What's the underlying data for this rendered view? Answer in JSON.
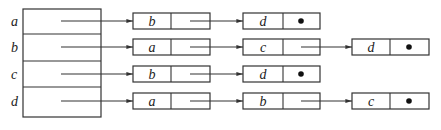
{
  "diagram": {
    "title": "",
    "type": "adjacency-list",
    "colors": {
      "line": "#333333",
      "text": "#222222",
      "background": "#ffffff"
    },
    "headers": [
      {
        "label": "a",
        "list": [
          {
            "value": "b",
            "next": null
          },
          {
            "value": "d",
            "terminal": true
          }
        ]
      },
      {
        "label": "b",
        "list": [
          {
            "value": "a"
          },
          {
            "value": "c"
          },
          {
            "value": "d",
            "terminal": true
          }
        ]
      },
      {
        "label": "c",
        "list": [
          {
            "value": "b"
          },
          {
            "value": "d",
            "terminal": true
          }
        ]
      },
      {
        "label": "d",
        "list": [
          {
            "value": "a"
          },
          {
            "value": "b"
          },
          {
            "value": "c",
            "terminal": true
          }
        ]
      }
    ],
    "null_pointer_symbol": "●"
  }
}
